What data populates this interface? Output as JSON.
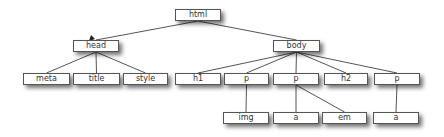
{
  "diagram": {
    "type": "tree",
    "nodes": [
      {
        "id": "html",
        "label": "html",
        "x": 175,
        "y": 9,
        "w": 46,
        "h": 12
      },
      {
        "id": "head",
        "label": "head",
        "x": 73,
        "y": 40,
        "w": 46,
        "h": 12
      },
      {
        "id": "body",
        "label": "body",
        "x": 273,
        "y": 40,
        "w": 47,
        "h": 12
      },
      {
        "id": "meta",
        "label": "meta",
        "x": 23,
        "y": 73,
        "w": 47,
        "h": 12
      },
      {
        "id": "title",
        "label": "title",
        "x": 73,
        "y": 73,
        "w": 47,
        "h": 12
      },
      {
        "id": "style",
        "label": "style",
        "x": 123,
        "y": 73,
        "w": 45,
        "h": 12
      },
      {
        "id": "h1",
        "label": "h1",
        "x": 175,
        "y": 73,
        "w": 46,
        "h": 12
      },
      {
        "id": "p1",
        "label": "p",
        "x": 224,
        "y": 73,
        "w": 45,
        "h": 12
      },
      {
        "id": "p2",
        "label": "p",
        "x": 273,
        "y": 73,
        "w": 46,
        "h": 12
      },
      {
        "id": "h2",
        "label": "h2",
        "x": 324,
        "y": 73,
        "w": 44,
        "h": 12
      },
      {
        "id": "p3",
        "label": "p",
        "x": 374,
        "y": 73,
        "w": 46,
        "h": 12
      },
      {
        "id": "img",
        "label": "img",
        "x": 223,
        "y": 112,
        "w": 46,
        "h": 12
      },
      {
        "id": "a1",
        "label": "a",
        "x": 273,
        "y": 112,
        "w": 46,
        "h": 12
      },
      {
        "id": "em",
        "label": "em",
        "x": 322,
        "y": 112,
        "w": 45,
        "h": 12
      },
      {
        "id": "a2",
        "label": "a",
        "x": 373,
        "y": 112,
        "w": 46,
        "h": 12
      }
    ],
    "edges": [
      [
        "html",
        "head"
      ],
      [
        "html",
        "body"
      ],
      [
        "head",
        "meta"
      ],
      [
        "head",
        "title"
      ],
      [
        "head",
        "style"
      ],
      [
        "body",
        "h1"
      ],
      [
        "body",
        "p1"
      ],
      [
        "body",
        "p2"
      ],
      [
        "body",
        "h2"
      ],
      [
        "body",
        "p3"
      ],
      [
        "p1",
        "img"
      ],
      [
        "p2",
        "a1"
      ],
      [
        "p2",
        "em"
      ],
      [
        "p3",
        "a2"
      ]
    ],
    "line_color": "#555555"
  }
}
